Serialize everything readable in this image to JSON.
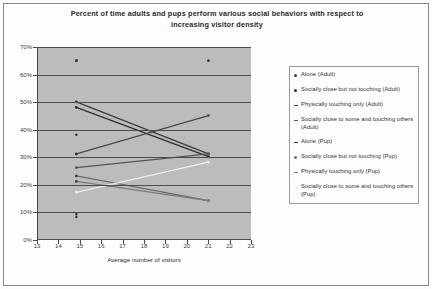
{
  "chart_data": {
    "type": "line",
    "title": "Percent of time adults and pups perform various social behaviors with respect to increasing visitor density",
    "xlabel": "Average number of visitors",
    "ylabel": "",
    "xlim": [
      13,
      23
    ],
    "ylim": [
      0,
      70
    ],
    "grid": true,
    "legend_position": "right",
    "xticks": [
      "13",
      "14",
      "15",
      "16",
      "17",
      "18",
      "19",
      "20",
      "21",
      "22",
      "23"
    ],
    "yticks": [
      "0%",
      "10%",
      "20%",
      "30%",
      "40%",
      "50%",
      "60%",
      "70%"
    ],
    "x": [
      14.8,
      21.0
    ],
    "series": [
      {
        "name": "Alone (Adult)",
        "values": [
          50,
          31
        ],
        "color": "#3d3d3d"
      },
      {
        "name": "Socially close but not touching (Adult)",
        "values": [
          48,
          30
        ],
        "color": "#2f2f2f"
      },
      {
        "name": "Physically touching only (Adult)",
        "values": [
          31,
          45
        ],
        "color": "#4a4a4a"
      },
      {
        "name": "Socially close to some and touching others (Adult)",
        "values": [
          26,
          31
        ],
        "color": "#555555"
      },
      {
        "name": "Alone (Pup)",
        "values": [
          65,
          65
        ],
        "color": "#3a3a3a"
      },
      {
        "name": "Socially close but not touching (Pup)",
        "values": [
          23,
          14
        ],
        "color": "#6d6d6d"
      },
      {
        "name": "Physically touching only (Pup)",
        "values": [
          21,
          14
        ],
        "color": "#7a7a7a"
      },
      {
        "name": "Socially close to some and touching others (Pup)",
        "values": [
          17,
          28
        ],
        "color": "#ededed"
      }
    ],
    "extra_points": [
      {
        "x": 14.8,
        "y": 65
      },
      {
        "x": 14.8,
        "y": 48
      },
      {
        "x": 14.8,
        "y": 38
      },
      {
        "x": 14.8,
        "y": 31
      },
      {
        "x": 14.8,
        "y": 23
      },
      {
        "x": 14.8,
        "y": 21
      },
      {
        "x": 14.8,
        "y": 9
      },
      {
        "x": 14.8,
        "y": 8
      }
    ]
  },
  "legend": {
    "items": [
      {
        "label": "Alone (Adult)",
        "marker": "dot"
      },
      {
        "label": "Socially close but not touching (Adult)",
        "marker": "dot"
      },
      {
        "label": "Physically touching only (Adult)",
        "marker": "dash"
      },
      {
        "label": "Socially close to some and touching others (Adult)",
        "marker": "dash"
      },
      {
        "label": "Alone (Pup)",
        "marker": "dash"
      },
      {
        "label": "Socially close but not touching (Pup)",
        "marker": "dot"
      },
      {
        "label": "Physically touching only (Pup)",
        "marker": "dash"
      },
      {
        "label": "Socially close to some and touching others (Pup)",
        "marker": "dash"
      }
    ]
  }
}
